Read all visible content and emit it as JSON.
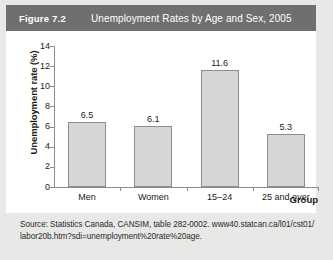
{
  "figure": {
    "number": "Figure 7.2",
    "title": "Unemployment Rates by Age and Sex, 2005"
  },
  "source": {
    "line1": "Source: Statistics Canada, CANSIM, table 282-0002. www40.statcan.ca/l01/cst01/",
    "line2": "labor20b.htm?sdi=unemployment%20rate%20age."
  },
  "colors": {
    "header_bg": "#6f6f6f",
    "header_text": "#ffffff",
    "bar_fill": "#d6d6d6",
    "bar_stroke": "#8d8d8d",
    "page_bg": "#e8e8e6",
    "card_bg": "#ffffff"
  },
  "chart_data": {
    "type": "bar",
    "title": "Unemployment Rates by Age and Sex, 2005",
    "xlabel": "Group",
    "ylabel": "Unemployment rate (%)",
    "categories": [
      "Men",
      "Women",
      "15–24",
      "25 and over"
    ],
    "values": [
      6.5,
      6.1,
      11.6,
      5.3
    ],
    "value_labels": [
      "6.5",
      "6.1",
      "11.6",
      "5.3"
    ],
    "ylim": [
      0,
      14
    ],
    "yticks": [
      0,
      2,
      4,
      6,
      8,
      10,
      12,
      14
    ],
    "ytick_labels": [
      "0",
      "2",
      "4",
      "6",
      "8",
      "10",
      "12",
      "14"
    ],
    "grid": false,
    "legend": false
  }
}
